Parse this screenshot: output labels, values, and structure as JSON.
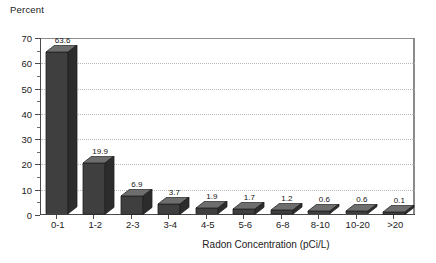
{
  "chart_data": {
    "type": "bar",
    "title": "",
    "ylabel": "Percent",
    "xlabel": "Radon Concentration (pCi/L)",
    "categories": [
      "0-1",
      "1-2",
      "2-3",
      "3-4",
      "4-5",
      "5-6",
      "6-8",
      "8-10",
      "10-20",
      ">20"
    ],
    "values": [
      63.6,
      19.9,
      6.9,
      3.7,
      1.9,
      1.7,
      1.2,
      0.6,
      0.6,
      0.1
    ],
    "value_labels": [
      "63.6",
      "19.9",
      "6.9",
      "3.7",
      "1.9",
      "1.7",
      "1.2",
      "0.6",
      "0.6",
      "0.1"
    ],
    "ylim": [
      0,
      70
    ],
    "ytick_labels": [
      "0",
      "10",
      "20",
      "30",
      "40",
      "50",
      "60",
      "70"
    ],
    "ytick_values": [
      0,
      10,
      20,
      30,
      40,
      50,
      60,
      70
    ],
    "yminor_values": [
      5,
      15,
      25,
      35,
      45,
      55,
      65
    ],
    "gridlines": [
      10,
      20,
      30,
      40,
      50,
      60
    ],
    "grid": true,
    "grid_style": "dotted",
    "legend": null,
    "legend_position": "none",
    "style": "3d-bar",
    "colors": {
      "bar_front": "#3f3f3f",
      "bar_top": "#6e6e6e",
      "bar_side": "#2c2c2c",
      "grid": "#b9b9b9",
      "axis": "#4a4a4a",
      "text": "#222222",
      "background": "#ffffff"
    }
  }
}
